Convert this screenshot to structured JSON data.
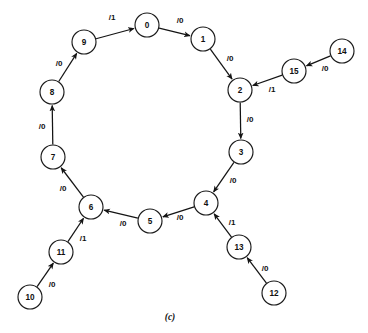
{
  "figure": {
    "caption": "(c)",
    "caption_x": 170,
    "caption_y": 317,
    "background_color": "#ffffff",
    "stroke_color": "#141414",
    "node_fill_color": "#ffffff",
    "node_radius": 12
  },
  "chart_data": {
    "type": "diagram",
    "title": "",
    "subtype": "state-transition-graph",
    "node_radius": 12,
    "nodes": [
      {
        "id": "0",
        "label": "0",
        "x": 147,
        "y": 25
      },
      {
        "id": "1",
        "label": "1",
        "x": 203,
        "y": 39
      },
      {
        "id": "2",
        "label": "2",
        "x": 240,
        "y": 90
      },
      {
        "id": "3",
        "label": "3",
        "x": 241,
        "y": 152
      },
      {
        "id": "4",
        "label": "4",
        "x": 206,
        "y": 203
      },
      {
        "id": "5",
        "label": "5",
        "x": 150,
        "y": 221
      },
      {
        "id": "6",
        "label": "6",
        "x": 91,
        "y": 207
      },
      {
        "id": "7",
        "label": "7",
        "x": 53,
        "y": 157
      },
      {
        "id": "8",
        "label": "8",
        "x": 52,
        "y": 92
      },
      {
        "id": "9",
        "label": "9",
        "x": 84,
        "y": 42
      },
      {
        "id": "10",
        "label": "10",
        "x": 30,
        "y": 297
      },
      {
        "id": "11",
        "label": "11",
        "x": 61,
        "y": 252
      },
      {
        "id": "12",
        "label": "12",
        "x": 274,
        "y": 293
      },
      {
        "id": "13",
        "label": "13",
        "x": 239,
        "y": 247
      },
      {
        "id": "14",
        "label": "14",
        "x": 342,
        "y": 51
      },
      {
        "id": "15",
        "label": "15",
        "x": 294,
        "y": 71
      }
    ],
    "edges": [
      {
        "from": "9",
        "to": "0",
        "label": "/1",
        "lx": 112,
        "ly": 17
      },
      {
        "from": "0",
        "to": "1",
        "label": "/0",
        "lx": 180,
        "ly": 20
      },
      {
        "from": "1",
        "to": "2",
        "label": "/0",
        "lx": 230,
        "ly": 58
      },
      {
        "from": "2",
        "to": "3",
        "label": "/0",
        "lx": 250,
        "ly": 119
      },
      {
        "from": "3",
        "to": "4",
        "label": "/0",
        "lx": 233,
        "ly": 180
      },
      {
        "from": "4",
        "to": "5",
        "label": "/0",
        "lx": 180,
        "ly": 217
      },
      {
        "from": "5",
        "to": "6",
        "label": "/0",
        "lx": 123,
        "ly": 223
      },
      {
        "from": "6",
        "to": "7",
        "label": "/0",
        "lx": 63,
        "ly": 188
      },
      {
        "from": "7",
        "to": "8",
        "label": "/0",
        "lx": 42,
        "ly": 126
      },
      {
        "from": "8",
        "to": "9",
        "label": "/0",
        "lx": 59,
        "ly": 63
      },
      {
        "from": "10",
        "to": "11",
        "label": "/0",
        "lx": 52,
        "ly": 284
      },
      {
        "from": "11",
        "to": "6",
        "label": "/1",
        "lx": 83,
        "ly": 238
      },
      {
        "from": "12",
        "to": "13",
        "label": "/0",
        "lx": 265,
        "ly": 268
      },
      {
        "from": "13",
        "to": "4",
        "label": "/1",
        "lx": 232,
        "ly": 222
      },
      {
        "from": "14",
        "to": "15",
        "label": "/0",
        "lx": 325,
        "ly": 68
      },
      {
        "from": "15",
        "to": "2",
        "label": "/1",
        "lx": 272,
        "ly": 89
      }
    ],
    "annotations": [
      "(c)"
    ],
    "grid": false,
    "legend": null
  }
}
